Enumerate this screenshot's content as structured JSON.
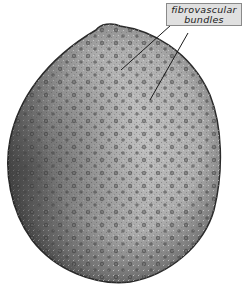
{
  "figure": {
    "label": {
      "line1": "fibrovascular",
      "line2": "bundles"
    },
    "colors": {
      "background": "#ffffff",
      "ground_tissue": "#b8b8b8",
      "rim": "#3a3a3a",
      "bundle": "#2e2e2e",
      "label_box": "#e0e0e0"
    }
  }
}
